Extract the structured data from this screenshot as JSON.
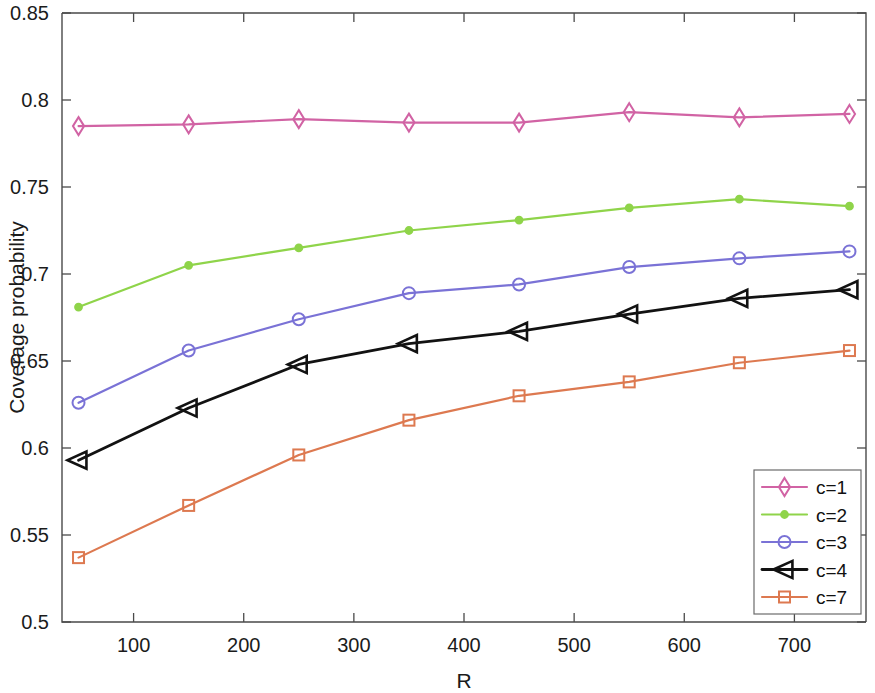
{
  "chart_data": {
    "type": "line",
    "title": "",
    "xlabel": "R",
    "ylabel": "Coverage probability",
    "xlim": [
      35,
      765
    ],
    "ylim": [
      0.5,
      0.85
    ],
    "grid": false,
    "legend_position": "lower-right",
    "x": [
      50,
      150,
      250,
      350,
      450,
      550,
      650,
      750
    ],
    "xticks": [
      100,
      200,
      300,
      400,
      500,
      600,
      700
    ],
    "xtick_labels": [
      "100",
      "200",
      "300",
      "400",
      "500",
      "600",
      "700"
    ],
    "yticks": [
      0.5,
      0.55,
      0.6,
      0.65,
      0.7,
      0.75,
      0.8,
      0.85
    ],
    "ytick_labels": [
      "0.5",
      "0.55",
      "0.6",
      "0.65",
      "0.7",
      "0.75",
      "0.8",
      "0.85"
    ],
    "series": [
      {
        "name": "c=1",
        "color": "#d163a4",
        "marker": "diamond",
        "values": [
          0.785,
          0.786,
          0.789,
          0.787,
          0.787,
          0.793,
          0.79,
          0.792
        ]
      },
      {
        "name": "c=2",
        "color": "#8fd44a",
        "marker": "dot",
        "values": [
          0.681,
          0.705,
          0.715,
          0.725,
          0.731,
          0.738,
          0.743,
          0.739
        ]
      },
      {
        "name": "c=3",
        "color": "#7a72d6",
        "marker": "circle",
        "values": [
          0.626,
          0.656,
          0.674,
          0.689,
          0.694,
          0.704,
          0.709,
          0.713
        ]
      },
      {
        "name": "c=4",
        "color": "#121212",
        "marker": "left-triangle",
        "values": [
          0.593,
          0.623,
          0.648,
          0.66,
          0.667,
          0.677,
          0.686,
          0.691
        ]
      },
      {
        "name": "c=7",
        "color": "#dd7950",
        "marker": "square",
        "values": [
          0.537,
          0.567,
          0.596,
          0.616,
          0.63,
          0.638,
          0.649,
          0.656
        ]
      }
    ]
  },
  "legend": {
    "entries": [
      "c=1",
      "c=2",
      "c=3",
      "c=4",
      "c=7"
    ]
  },
  "axes": {
    "x_title": "R",
    "y_title": "Coverage probability"
  }
}
